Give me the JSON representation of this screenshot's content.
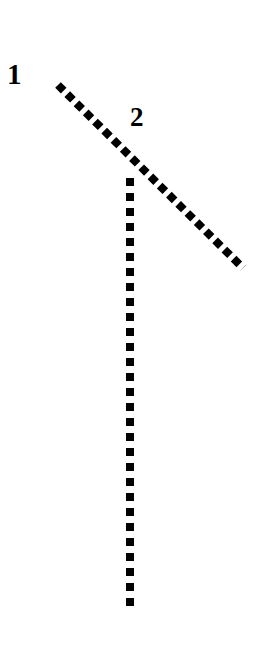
{
  "figure": {
    "width": 257,
    "height": 645,
    "background_color": "#ffffff",
    "stroke_color": "#000000"
  },
  "labels": [
    {
      "text": "1",
      "x": 7,
      "y": 60,
      "font_size": 29
    },
    {
      "text": "2",
      "x": 130,
      "y": 104,
      "font_size": 27
    }
  ],
  "chart_data": {
    "type": "line",
    "title": "",
    "xlabel": "",
    "ylabel": "",
    "grid": false,
    "legend_position": "inline-annotations",
    "axis_ranges": {
      "x": [
        0,
        257
      ],
      "y": [
        0,
        645
      ]
    },
    "annotations": [
      {
        "label": "1",
        "x": 7,
        "y": 60,
        "refers_to": "diagonal-dashed-line"
      },
      {
        "label": "2",
        "x": 130,
        "y": 104,
        "refers_to": "vertical-dashed-line"
      }
    ],
    "series": [
      {
        "name": "1",
        "style": "dashed",
        "dash_shape": "diamond",
        "dash_size": 8,
        "dash_period": 13,
        "stroke_width": 8,
        "color": "#000000",
        "points": [
          {
            "x": 58,
            "y": 85
          },
          {
            "x": 243,
            "y": 268
          }
        ]
      },
      {
        "name": "2",
        "style": "dashed",
        "dash_shape": "square",
        "dash_size": 8,
        "dash_period": 15,
        "stroke_width": 8,
        "color": "#000000",
        "points": [
          {
            "x": 130,
            "y": 178
          },
          {
            "x": 130,
            "y": 613
          }
        ]
      }
    ],
    "intersection": {
      "x": 130,
      "y": 158
    }
  }
}
